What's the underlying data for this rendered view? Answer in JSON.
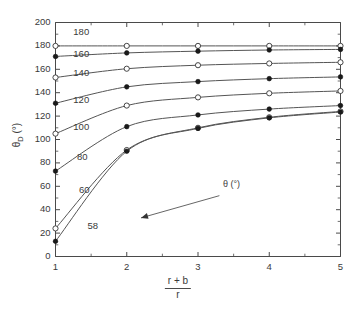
{
  "chart_data": {
    "type": "line",
    "title": "",
    "xlabel": "(r + b) / r",
    "xlabel_numerator": "r + b",
    "xlabel_denominator": "r",
    "ylabel": "θD (°)",
    "ylabel_main": "θ",
    "ylabel_sub": "D",
    "ylabel_unit": " (°)",
    "x": [
      1,
      2,
      3,
      4,
      5
    ],
    "xlim": [
      1,
      5
    ],
    "ylim": [
      0,
      200
    ],
    "xticks": [
      1,
      2,
      3,
      4,
      5
    ],
    "xticklabels": [
      "1",
      "2",
      "3",
      "4",
      "5"
    ],
    "xminorticks": [
      1.5,
      2.5,
      3.5,
      4.5
    ],
    "yticks": [
      0,
      20,
      40,
      60,
      80,
      100,
      120,
      140,
      160,
      180,
      200
    ],
    "yticklabels": [
      "0",
      "20",
      "40",
      "60",
      "80",
      "100",
      "120",
      "140",
      "160",
      "180",
      "200"
    ],
    "grid": false,
    "legend": "inline-curve-labels",
    "annotation_text": "θ (°)",
    "annotation_target_label": "58",
    "series": [
      {
        "name": "180",
        "label": "180",
        "marker": "open-circle",
        "values": [
          180.0,
          180.0,
          180.0,
          180.0,
          180.0
        ]
      },
      {
        "name": "160",
        "label": "160",
        "marker": "filled-circle",
        "values": [
          171.0,
          174.0,
          175.5,
          176.5,
          177.0
        ]
      },
      {
        "name": "140",
        "label": "140",
        "marker": "open-circle",
        "values": [
          153.0,
          160.5,
          163.5,
          165.0,
          166.0
        ]
      },
      {
        "name": "120",
        "label": "120",
        "marker": "filled-circle",
        "values": [
          131.0,
          145.0,
          149.5,
          152.0,
          153.5
        ]
      },
      {
        "name": "100",
        "label": "100",
        "marker": "open-circle",
        "values": [
          105.0,
          129.0,
          136.0,
          139.5,
          141.5
        ]
      },
      {
        "name": "80",
        "label": "80",
        "marker": "filled-circle",
        "values": [
          73.0,
          111.0,
          121.0,
          126.0,
          129.0
        ]
      },
      {
        "name": "60",
        "label": "60",
        "marker": "open-circle",
        "values": [
          24.0,
          91.0,
          110.0,
          119.0,
          124.0
        ]
      },
      {
        "name": "58",
        "label": "58",
        "marker": "filled-circle",
        "values": [
          13.0,
          90.0,
          109.5,
          118.5,
          123.5
        ]
      }
    ],
    "colors": {
      "axis": "#4a4a4a",
      "curve": "#555555",
      "text": "#3a3a3a",
      "marker_fill_open": "#ffffff",
      "marker_fill_closed": "#1a1a1a"
    },
    "curve_label_positions": [
      {
        "label": "180",
        "x": 1.25,
        "y": 191
      },
      {
        "label": "160",
        "x": 1.25,
        "y": 172
      },
      {
        "label": "140",
        "x": 1.25,
        "y": 156
      },
      {
        "label": "120",
        "x": 1.25,
        "y": 133
      },
      {
        "label": "100",
        "x": 1.25,
        "y": 110
      },
      {
        "label": "80",
        "x": 1.3,
        "y": 84
      },
      {
        "label": "60",
        "x": 1.33,
        "y": 56
      },
      {
        "label": "58",
        "x": 1.45,
        "y": 25
      }
    ]
  }
}
